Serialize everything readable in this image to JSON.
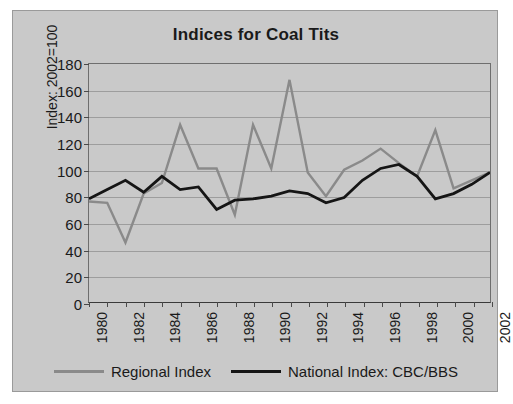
{
  "chart_data": {
    "type": "line",
    "title": "Indices for Coal Tits",
    "xlabel": "",
    "ylabel": "Index: 2002=100",
    "xlim": [
      1980,
      2002
    ],
    "ylim": [
      0,
      180
    ],
    "ytick_step": 20,
    "xtick_step": 2,
    "grid": true,
    "grid_axis": "y",
    "legend_position": "bottom",
    "x": [
      1980,
      1981,
      1982,
      1983,
      1984,
      1985,
      1986,
      1987,
      1988,
      1989,
      1990,
      1991,
      1992,
      1993,
      1994,
      1995,
      1996,
      1997,
      1998,
      1999,
      2000,
      2001,
      2002
    ],
    "ytick_labels": [
      "0",
      "20",
      "40",
      "60",
      "80",
      "100",
      "120",
      "140",
      "160",
      "180"
    ],
    "ytick_values": [
      0,
      20,
      40,
      60,
      80,
      100,
      120,
      140,
      160,
      180
    ],
    "xtick_labels": [
      "1980",
      "1982",
      "1984",
      "1986",
      "1988",
      "1990",
      "1992",
      "1994",
      "1996",
      "1998",
      "2000",
      "2002"
    ],
    "xtick_values": [
      1980,
      1982,
      1984,
      1986,
      1988,
      1990,
      1992,
      1994,
      1996,
      1998,
      2000,
      2002
    ],
    "series": [
      {
        "name": "Regional Index",
        "color": "#8a8a8a",
        "width": 2.4,
        "values": [
          76,
          75,
          45,
          82,
          90,
          134,
          101,
          101,
          66,
          134,
          101,
          168,
          98,
          80,
          100,
          107,
          116,
          105,
          95,
          130,
          86,
          92,
          98
        ]
      },
      {
        "name": "National Index: CBC/BBS",
        "color": "#151515",
        "width": 2.8,
        "values": [
          78,
          85,
          92,
          83,
          95,
          85,
          87,
          70,
          77,
          78,
          80,
          84,
          82,
          75,
          79,
          92,
          101,
          104,
          95,
          78,
          82,
          89,
          98
        ]
      }
    ]
  },
  "figure": {
    "background": "#c9c9c9",
    "border_color": "#9a9a9a",
    "plot_border_color": "#6e6e6e",
    "gridline_color": "#9d9d9d"
  },
  "legend": {
    "entries": [
      {
        "label": "Regional Index",
        "color": "#8a8a8a"
      },
      {
        "label": "National Index: CBC/BBS",
        "color": "#151515"
      }
    ]
  }
}
